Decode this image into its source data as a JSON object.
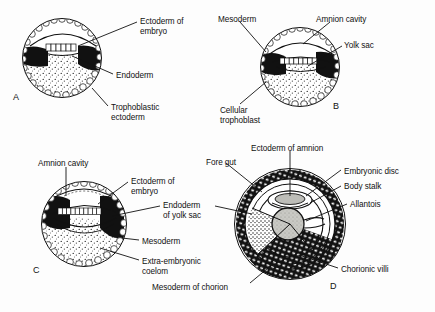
{
  "figure": {
    "background_color": "#fdfdfd",
    "ink_color": "#111111",
    "panels": [
      {
        "letter": "A",
        "letter_x": 13,
        "letter_y": 92,
        "center_x": 62,
        "center_y": 58,
        "radius": 40,
        "labels": [
          {
            "name": "ectoderm-of-embryo",
            "text": "Ectoderm of\nembryo",
            "x": 140,
            "y": 17
          },
          {
            "name": "endoderm",
            "text": "Endoderm",
            "x": 116,
            "y": 71
          },
          {
            "name": "trophoblastic-ectoderm",
            "text": "Trophoblastic\nectoderm",
            "x": 111,
            "y": 103
          }
        ]
      },
      {
        "letter": "B",
        "letter_x": 333,
        "letter_y": 101,
        "center_x": 300,
        "center_y": 67,
        "radius": 40,
        "labels": [
          {
            "name": "mesoderm",
            "text": "Mesoderm",
            "x": 218,
            "y": 15
          },
          {
            "name": "amnion-cavity",
            "text": "Amnion cavity",
            "x": 316,
            "y": 15
          },
          {
            "name": "yolk-sac",
            "text": "Yolk sac",
            "x": 344,
            "y": 41
          },
          {
            "name": "cellular-trophoblast",
            "text": "Cellular\ntrophoblast",
            "x": 220,
            "y": 106
          }
        ]
      },
      {
        "letter": "C",
        "letter_x": 33,
        "letter_y": 265,
        "center_x": 84,
        "center_y": 224,
        "radius": 43,
        "labels": [
          {
            "name": "amnion-cavity",
            "text": "Amnion cavity",
            "x": 38,
            "y": 159
          },
          {
            "name": "ectoderm-of-embryo",
            "text": "Ectoderm of\nembryo",
            "x": 131,
            "y": 177
          },
          {
            "name": "endoderm-of-yolk-sac",
            "text": "Endoderm\nof yolk sac",
            "x": 163,
            "y": 201
          },
          {
            "name": "mesoderm",
            "text": "Mesoderm",
            "x": 142,
            "y": 237
          },
          {
            "name": "extra-embryonic-coelom",
            "text": "Extra-embryonic\ncoelom",
            "x": 142,
            "y": 257
          }
        ]
      },
      {
        "letter": "D",
        "letter_x": 330,
        "letter_y": 281,
        "center_x": 290,
        "center_y": 224,
        "radius": 56,
        "labels": [
          {
            "name": "fore-gut",
            "text": "Fore gut",
            "x": 206,
            "y": 158
          },
          {
            "name": "ectoderm-of-amnion",
            "text": "Ectoderm of amnion",
            "x": 251,
            "y": 144
          },
          {
            "name": "embryonic-disc",
            "text": "Embryonic disc",
            "x": 344,
            "y": 167
          },
          {
            "name": "body-stalk",
            "text": "Body stalk",
            "x": 344,
            "y": 182
          },
          {
            "name": "allantois",
            "text": "Allantois",
            "x": 350,
            "y": 200
          },
          {
            "name": "chorionic-villi",
            "text": "Chorionic villi",
            "x": 341,
            "y": 265
          },
          {
            "name": "mesoderm-of-chorion",
            "text": "Mesoderm of chorion",
            "x": 152,
            "y": 283
          }
        ]
      }
    ]
  }
}
